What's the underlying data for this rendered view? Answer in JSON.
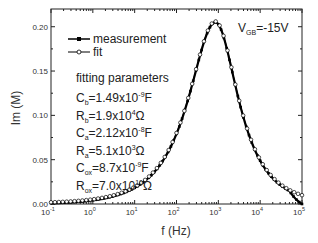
{
  "chart_data": {
    "type": "line",
    "title": "",
    "xlabel": "f (Hz)",
    "ylabel": "Im (M)",
    "xscale": "log",
    "xlim": [
      0.1,
      100000
    ],
    "ylim": [
      0.0,
      0.22
    ],
    "x_ticks": [
      {
        "base": "10",
        "exp": "-1",
        "value": 0.1
      },
      {
        "base": "10",
        "exp": "0",
        "value": 1
      },
      {
        "base": "10",
        "exp": "1",
        "value": 10
      },
      {
        "base": "10",
        "exp": "2",
        "value": 100
      },
      {
        "base": "10",
        "exp": "3",
        "value": 1000
      },
      {
        "base": "10",
        "exp": "4",
        "value": 10000
      },
      {
        "base": "10",
        "exp": "5",
        "value": 100000
      }
    ],
    "y_ticks": [
      "0.00",
      "0.05",
      "0.10",
      "0.15",
      "0.20"
    ],
    "y_tick_values": [
      0.0,
      0.05,
      0.1,
      0.15,
      0.2
    ],
    "grid": false,
    "legend_position": "upper-left",
    "annotation": {
      "text": "V",
      "sub": "GB",
      "rest": "=-15V"
    },
    "peak": {
      "f": 850,
      "im": 0.205
    },
    "series": [
      {
        "name": "measurement",
        "marker": "filled-square",
        "color": "#000000",
        "x": [
          0.1,
          0.3,
          1,
          3,
          10,
          20,
          50,
          100,
          200,
          300,
          500,
          700,
          850,
          1000,
          1500,
          2000,
          3000,
          5000,
          10000,
          20000,
          50000,
          100000
        ],
        "values": [
          0.0,
          0.0005,
          0.001,
          0.003,
          0.008,
          0.016,
          0.037,
          0.063,
          0.1,
          0.13,
          0.175,
          0.2,
          0.205,
          0.2,
          0.175,
          0.15,
          0.113,
          0.075,
          0.04,
          0.02,
          0.008,
          0.0
        ]
      },
      {
        "name": "fit",
        "marker": "open-circle",
        "color": "#000000",
        "x": [
          0.1,
          0.3,
          1,
          3,
          10,
          20,
          50,
          100,
          200,
          300,
          500,
          700,
          850,
          1000,
          1500,
          2000,
          3000,
          5000,
          10000,
          20000,
          50000,
          100000
        ],
        "values": [
          0.0,
          0.0005,
          0.001,
          0.003,
          0.009,
          0.017,
          0.038,
          0.065,
          0.102,
          0.132,
          0.177,
          0.2,
          0.205,
          0.2,
          0.176,
          0.152,
          0.115,
          0.077,
          0.041,
          0.021,
          0.009,
          0.003
        ]
      }
    ]
  },
  "legend": {
    "items": [
      {
        "label": "measurement",
        "marker": "filled-square"
      },
      {
        "label": "fit",
        "marker": "open-circle"
      }
    ]
  },
  "fitting": {
    "title": "fitting parameters",
    "params": [
      {
        "sym": "C",
        "sub": "b",
        "eq": "=1.49x10",
        "exp": "-9",
        "unit": "F"
      },
      {
        "sym": "R",
        "sub": "b",
        "eq": "=1.9x10",
        "exp": "4",
        "unit": "Ω"
      },
      {
        "sym": "C",
        "sub": "a",
        "eq": "=2.12x10",
        "exp": "-8",
        "unit": "F"
      },
      {
        "sym": "R",
        "sub": "a",
        "eq": "=5.1x10",
        "exp": "3",
        "unit": "Ω"
      },
      {
        "sym": "C",
        "sub": "ox",
        "eq": "=8.7x10",
        "exp": "-9",
        "unit": "F"
      },
      {
        "sym": "R",
        "sub": "ox",
        "eq": "=7.0x10",
        "exp": "10",
        "unit": "Ω"
      }
    ]
  }
}
